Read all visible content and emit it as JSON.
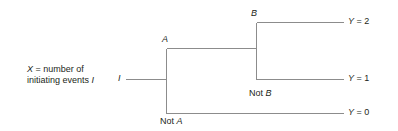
{
  "diagram": {
    "line_color": "#8c8c8c",
    "text_color": "#231f20",
    "background": "#ffffff",
    "description": {
      "line1_prefix": "X",
      "line1": "X = number of",
      "line2": "initiating events I"
    },
    "nodes": {
      "initiator": "I",
      "branch_a_yes": "A",
      "branch_a_no": "Not A",
      "branch_b_yes": "B",
      "branch_b_no": "Not B"
    },
    "outcomes": [
      {
        "label": "Y = 2",
        "value": 2
      },
      {
        "label": "Y = 1",
        "value": 1
      },
      {
        "label": "Y = 0",
        "value": 0
      }
    ]
  }
}
